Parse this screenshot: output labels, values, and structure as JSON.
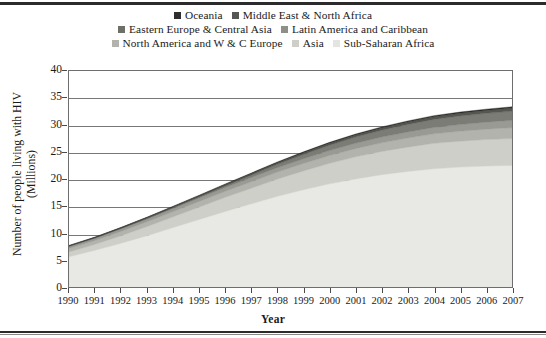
{
  "chart_data": {
    "type": "area",
    "stacked": true,
    "title": "",
    "subtitle": "",
    "xlabel": "Year",
    "ylabel": "Number of people living with HIV (Millions)",
    "ylabel_line1": "Number of people living with HIV",
    "ylabel_line2": "(Millions)",
    "xlim": [
      1990,
      2007
    ],
    "ylim": [
      0,
      40
    ],
    "yticks": [
      0,
      5,
      10,
      15,
      20,
      25,
      30,
      35,
      40
    ],
    "grid": true,
    "legend_position": "top",
    "categories": [
      1990,
      1991,
      1992,
      1993,
      1994,
      1995,
      1996,
      1997,
      1998,
      1999,
      2000,
      2001,
      2002,
      2003,
      2004,
      2005,
      2006,
      2007
    ],
    "x": [
      "1990",
      "1991",
      "1992",
      "1993",
      "1994",
      "1995",
      "1996",
      "1997",
      "1998",
      "1999",
      "2000",
      "2001",
      "2002",
      "2003",
      "2004",
      "2005",
      "2006",
      "2007"
    ],
    "stack_order_bottom_to_top": [
      "Sub-Saharan Africa",
      "Asia",
      "North America and W & C Europe",
      "Latin America and Caribbean",
      "Eastern Europe & Central Asia",
      "Middle East & North Africa",
      "Oceania"
    ],
    "series": [
      {
        "name": "Sub-Saharan Africa",
        "color": "#e8e8e4",
        "values": [
          5.6,
          6.8,
          8.1,
          9.5,
          11.0,
          12.5,
          14.0,
          15.4,
          16.8,
          18.0,
          19.1,
          20.0,
          20.8,
          21.4,
          21.9,
          22.2,
          22.4,
          22.5
        ]
      },
      {
        "name": "Asia",
        "color": "#cfcfc9",
        "values": [
          0.9,
          1.1,
          1.4,
          1.7,
          2.0,
          2.3,
          2.6,
          2.9,
          3.2,
          3.5,
          3.8,
          4.1,
          4.3,
          4.5,
          4.7,
          4.8,
          4.9,
          5.0
        ]
      },
      {
        "name": "North America and W & C Europe",
        "color": "#b3b3ad",
        "values": [
          0.65,
          0.72,
          0.8,
          0.88,
          0.96,
          1.04,
          1.12,
          1.2,
          1.28,
          1.36,
          1.44,
          1.52,
          1.6,
          1.68,
          1.76,
          1.84,
          1.92,
          2.0
        ]
      },
      {
        "name": "Latin America and Caribbean",
        "color": "#9a9a94",
        "values": [
          0.35,
          0.4,
          0.46,
          0.52,
          0.58,
          0.64,
          0.7,
          0.76,
          0.82,
          0.88,
          0.94,
          1.0,
          1.06,
          1.12,
          1.18,
          1.24,
          1.3,
          1.36
        ]
      },
      {
        "name": "Eastern Europe & Central Asia",
        "color": "#7c7c76",
        "values": [
          0.05,
          0.06,
          0.08,
          0.1,
          0.14,
          0.2,
          0.3,
          0.45,
          0.62,
          0.8,
          0.98,
          1.14,
          1.28,
          1.4,
          1.5,
          1.58,
          1.64,
          1.7
        ]
      },
      {
        "name": "Middle East & North Africa",
        "color": "#575751",
        "values": [
          0.08,
          0.1,
          0.12,
          0.15,
          0.18,
          0.21,
          0.24,
          0.27,
          0.3,
          0.33,
          0.36,
          0.39,
          0.42,
          0.45,
          0.48,
          0.51,
          0.54,
          0.57
        ]
      },
      {
        "name": "Oceania",
        "color": "#2e2e2c",
        "values": [
          0.07,
          0.08,
          0.09,
          0.1,
          0.11,
          0.12,
          0.13,
          0.14,
          0.15,
          0.16,
          0.17,
          0.18,
          0.19,
          0.2,
          0.21,
          0.22,
          0.23,
          0.24
        ]
      }
    ],
    "totals": [
      7.7,
      9.26,
      10.95,
      12.85,
      14.97,
      17.01,
      19.09,
      21.02,
      23.17,
      25.03,
      26.79,
      28.33,
      29.65,
      30.75,
      31.72,
      32.39,
      32.93,
      33.37
    ]
  },
  "legend": {
    "rows": [
      [
        {
          "label": "Oceania",
          "color": "#2e2e2c"
        },
        {
          "label": "Middle East & North Africa",
          "color": "#575751"
        }
      ],
      [
        {
          "label": "Eastern Europe & Central Asia",
          "color": "#6f6f69"
        },
        {
          "label": "Latin America and Caribbean",
          "color": "#8f8f89"
        }
      ],
      [
        {
          "label": "North America and W & C Europe",
          "color": "#b3b3ad"
        },
        {
          "label": "Asia",
          "color": "#cfcfc9"
        },
        {
          "label": "Sub-Saharan Africa",
          "color": "#e4e4e0"
        }
      ]
    ]
  },
  "axes": {
    "y_tick_labels": [
      "40",
      "35",
      "30",
      "25",
      "20",
      "15",
      "10",
      "5",
      "0"
    ],
    "x_tick_labels": [
      "1990",
      "1991",
      "1992",
      "1993",
      "1994",
      "1995",
      "1996",
      "1997",
      "1998",
      "1999",
      "2000",
      "2001",
      "2002",
      "2003",
      "2004",
      "2005",
      "2006",
      "2007"
    ],
    "x_title": "Year",
    "y_title_line1": "Number of people living with HIV",
    "y_title_line2": "(Millions)"
  },
  "colors": {
    "frame": "#6e6e6e",
    "gridline": "#777777",
    "rule": "#2b2b2b",
    "background": "#ffffff",
    "text": "#1a1a1a"
  }
}
